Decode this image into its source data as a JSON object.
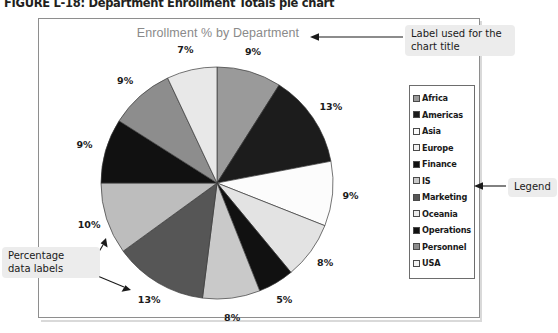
{
  "figure": {
    "caption": "FIGURE L-18: Department Enrollment Totals pie chart"
  },
  "chart_data": {
    "type": "pie",
    "title": "Enrollment % by Department",
    "xlabel": "",
    "ylabel": "",
    "legend_position": "right",
    "grid": false,
    "value_suffix": "%",
    "categories": [
      "Africa",
      "Americas",
      "Asia",
      "Europe",
      "Finance",
      "IS",
      "Marketing",
      "Oceania",
      "Operations",
      "Personnel",
      "USA"
    ],
    "values": [
      9,
      13,
      9,
      8,
      5,
      8,
      13,
      10,
      9,
      9,
      7
    ],
    "labels": [
      "9%",
      "13%",
      "9%",
      "8%",
      "5%",
      "8%",
      "13%",
      "10%",
      "9%",
      "9%",
      "7%"
    ],
    "colors": [
      "#9a9a9a",
      "#1c1c1c",
      "#fcfcfc",
      "#e3e3e3",
      "#111111",
      "#c9c9c9",
      "#565656",
      "#bdbdbd",
      "#111111",
      "#8d8d8d",
      "#e8e8e8"
    ]
  },
  "legend": {
    "items": [
      {
        "label": "Africa",
        "swatch": "#9a9a9a"
      },
      {
        "label": "Americas",
        "swatch": "#1c1c1c"
      },
      {
        "label": "Asia",
        "swatch": "#fcfcfc"
      },
      {
        "label": "Europe",
        "swatch": "#f2f2f2"
      },
      {
        "label": "Finance",
        "swatch": "#111111"
      },
      {
        "label": "IS",
        "swatch": "#c9c9c9"
      },
      {
        "label": "Marketing",
        "swatch": "#565656"
      },
      {
        "label": "Oceania",
        "swatch": "#ededed"
      },
      {
        "label": "Operations",
        "swatch": "#111111"
      },
      {
        "label": "Personnel",
        "swatch": "#8d8d8d"
      },
      {
        "label": "USA",
        "swatch": "#f4f4f4"
      }
    ]
  },
  "annotations": {
    "title_callout": "Label used for the\nchart title",
    "legend_callout": "Legend",
    "labels_callout": "Percentage\ndata labels"
  }
}
